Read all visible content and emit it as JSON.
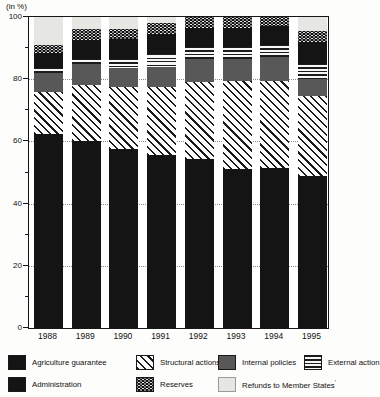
{
  "unit_label": "(in %)",
  "chart_data": {
    "type": "bar",
    "stacked": true,
    "title": "",
    "ylabel": "(in %)",
    "xlabel": "",
    "ylim": [
      0,
      100
    ],
    "yticks": [
      0,
      20,
      40,
      60,
      80,
      100
    ],
    "yticks_minor": [
      10,
      30,
      50,
      70,
      90
    ],
    "grid_at": [
      20,
      40,
      60,
      80
    ],
    "grid_style": "dotted horizontal",
    "legend_position": "bottom",
    "categories": [
      "1988",
      "1989",
      "1990",
      "1991",
      "1992",
      "1993",
      "1994",
      "1995"
    ],
    "series": [
      {
        "name": "Agriculture guarantee",
        "pattern": "agriculture",
        "color": "#141414",
        "values": [
          62.5,
          60.0,
          57.5,
          55.5,
          54.5,
          51.0,
          51.5,
          49.0
        ]
      },
      {
        "name": "Structural actions",
        "pattern": "structural",
        "color": "diagonal-hatch",
        "values": [
          13.5,
          18.0,
          20.0,
          22.0,
          24.5,
          28.5,
          28.0,
          25.5
        ]
      },
      {
        "name": "Internal policies",
        "pattern": "internal",
        "color": "#585858",
        "values": [
          6.0,
          7.0,
          6.0,
          6.5,
          7.5,
          7.0,
          7.5,
          5.5
        ]
      },
      {
        "name": "External action",
        "pattern": "external",
        "color": "horizontal-lines",
        "values": [
          1.5,
          1.5,
          3.0,
          4.0,
          4.0,
          4.0,
          4.0,
          5.0
        ]
      },
      {
        "name": "Administration",
        "pattern": "administration",
        "color": "#141414",
        "values": [
          5.0,
          6.0,
          6.5,
          6.5,
          6.0,
          6.0,
          6.0,
          7.0
        ]
      },
      {
        "name": "Reserves",
        "pattern": "reserves",
        "color": "black-white-dots",
        "values": [
          2.5,
          3.5,
          3.0,
          3.5,
          3.5,
          3.5,
          3.0,
          3.5
        ]
      },
      {
        "name": "Refunds to Member States",
        "pattern": "refunds",
        "color": "#e6e6e3",
        "footnote": "′",
        "values": [
          9.0,
          4.0,
          4.0,
          2.0,
          0,
          0,
          0,
          4.5
        ]
      }
    ],
    "legend_rows": [
      [
        0,
        1,
        2,
        3
      ],
      [
        4,
        5,
        6
      ]
    ]
  }
}
